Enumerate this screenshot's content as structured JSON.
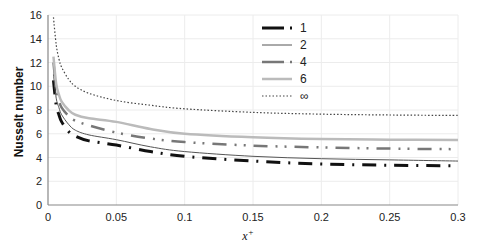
{
  "chart_data": {
    "type": "line",
    "title": "",
    "xlabel": "x+",
    "ylabel": "Nusselt number",
    "xlim": [
      0,
      0.3
    ],
    "ylim": [
      0,
      16
    ],
    "xticks": [
      "0",
      "0.05",
      "0.1",
      "0.15",
      "0.2",
      "0.25",
      "0.3"
    ],
    "yticks": [
      "0",
      "2",
      "4",
      "6",
      "8",
      "10",
      "12",
      "14",
      "16"
    ],
    "grid": true,
    "legend_position": "upper center",
    "x": [
      0.004,
      0.006,
      0.008,
      0.01,
      0.015,
      0.02,
      0.03,
      0.05,
      0.075,
      0.1,
      0.15,
      0.2,
      0.25,
      0.3
    ],
    "series": [
      {
        "name": "1",
        "style": "long-dash-dot heavy black",
        "color": "#111111",
        "values": [
          10.5,
          8.4,
          7.6,
          7.0,
          6.2,
          5.8,
          5.4,
          5.05,
          4.5,
          4.1,
          3.7,
          3.45,
          3.35,
          3.3
        ]
      },
      {
        "name": "2",
        "style": "thin solid",
        "color": "#555555",
        "values": [
          11.0,
          9.0,
          8.2,
          7.6,
          6.8,
          6.3,
          5.9,
          5.5,
          4.9,
          4.5,
          4.1,
          3.9,
          3.8,
          3.7
        ]
      },
      {
        "name": "4",
        "style": "dash-dot-dot grey",
        "color": "#777777",
        "values": [
          12.0,
          9.8,
          8.8,
          8.2,
          7.5,
          7.1,
          6.7,
          6.1,
          5.6,
          5.3,
          5.0,
          4.85,
          4.75,
          4.7
        ]
      },
      {
        "name": "6",
        "style": "solid light grey",
        "color": "#bbbbbb",
        "values": [
          12.5,
          10.2,
          9.3,
          8.7,
          8.0,
          7.6,
          7.3,
          7.0,
          6.4,
          6.0,
          5.7,
          5.55,
          5.5,
          5.47
        ]
      },
      {
        "name": "∞",
        "style": "dotted",
        "color": "#444444",
        "values": [
          15.8,
          13.5,
          12.3,
          11.6,
          10.6,
          10.0,
          9.4,
          8.8,
          8.4,
          8.1,
          7.8,
          7.65,
          7.58,
          7.54
        ]
      }
    ]
  },
  "axes": {
    "y_label": "Nusselt number",
    "x_label_base": "x",
    "x_label_sup": "+"
  },
  "legend": {
    "items": [
      {
        "label": "1"
      },
      {
        "label": "2"
      },
      {
        "label": "4"
      },
      {
        "label": "6"
      },
      {
        "label": "∞"
      }
    ]
  }
}
